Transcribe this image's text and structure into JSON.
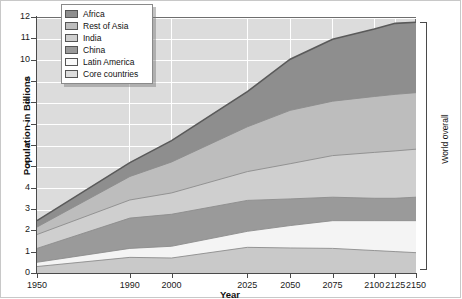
{
  "chart_data": {
    "type": "area",
    "title": "",
    "xlabel": "Year",
    "ylabel": "Population in Billions",
    "stacked": true,
    "grid": true,
    "legend_position": "top-left",
    "annotation": "World overall",
    "xlim": [
      1950,
      2150
    ],
    "ylim": [
      0,
      12
    ],
    "x_tick_labels": [
      "1950",
      "1990",
      "2000",
      "2025",
      "2050",
      "2075",
      "2100",
      "2125",
      "2150"
    ],
    "x": [
      1950,
      1990,
      2000,
      2025,
      2050,
      2075,
      2100,
      2125,
      2150
    ],
    "y_tick_labels": [
      "0",
      "1",
      "2",
      "3",
      "4",
      "5",
      "6",
      "7",
      "8",
      "9",
      "10",
      "11",
      "12"
    ],
    "y_ticks": [
      0,
      1,
      2,
      3,
      4,
      5,
      6,
      7,
      8,
      9,
      10,
      11,
      12
    ],
    "series": [
      {
        "name": "Core countries",
        "color": "#c9c9c9",
        "values": [
          0.35,
          0.78,
          0.75,
          1.25,
          1.22,
          1.2,
          1.1,
          1.05,
          1.0
        ]
      },
      {
        "name": "Latin America",
        "color": "#f4f4f4",
        "values": [
          0.2,
          0.42,
          0.55,
          0.75,
          1.05,
          1.3,
          1.4,
          1.45,
          1.5
        ]
      },
      {
        "name": "China",
        "color": "#9a9a9a",
        "values": [
          0.65,
          1.42,
          1.5,
          1.45,
          1.25,
          1.1,
          1.05,
          1.05,
          1.1
        ]
      },
      {
        "name": "India",
        "color": "#cfcfcf",
        "values": [
          0.65,
          0.85,
          1.0,
          1.35,
          1.65,
          1.95,
          2.15,
          2.22,
          2.25
        ]
      },
      {
        "name": "Rest of Asia",
        "color": "#bdbdbd",
        "values": [
          0.35,
          1.1,
          1.45,
          2.1,
          2.5,
          2.55,
          2.62,
          2.65,
          2.65
        ]
      },
      {
        "name": "Africa",
        "color": "#8e8e8e",
        "values": [
          0.3,
          0.65,
          1.0,
          1.65,
          2.4,
          2.9,
          3.16,
          3.33,
          3.3
        ]
      }
    ],
    "cumulative_tops": {
      "Core countries": [
        0.35,
        0.78,
        0.75,
        1.25,
        1.22,
        1.2,
        1.1,
        1.05,
        1.0
      ],
      "Latin America": [
        0.55,
        1.2,
        1.3,
        2.0,
        2.27,
        2.5,
        2.5,
        2.5,
        2.5
      ],
      "China": [
        1.2,
        2.62,
        2.8,
        3.45,
        3.52,
        3.6,
        3.55,
        3.55,
        3.6
      ],
      "India": [
        1.85,
        3.47,
        3.8,
        4.8,
        5.17,
        5.55,
        5.7,
        5.77,
        5.85
      ],
      "Rest of Asia": [
        2.2,
        4.57,
        5.25,
        6.9,
        7.67,
        8.1,
        8.32,
        8.42,
        8.5
      ],
      "Africa": [
        2.5,
        5.22,
        6.25,
        8.55,
        10.07,
        11.0,
        11.48,
        11.75,
        11.8
      ]
    }
  },
  "legend": {
    "items": [
      {
        "label": "Africa",
        "color": "#8e8e8e"
      },
      {
        "label": "Rest of Asia",
        "color": "#bdbdbd"
      },
      {
        "label": "India",
        "color": "#cfcfcf"
      },
      {
        "label": "China",
        "color": "#9a9a9a"
      },
      {
        "label": "Latin America",
        "color": "#f9f9f9"
      },
      {
        "label": "Core countries",
        "color": "#dcdcdc"
      }
    ]
  },
  "axes": {
    "y_title": "Population in Billions",
    "x_title": "Year"
  },
  "annotation": {
    "world_overall": "World overall"
  }
}
